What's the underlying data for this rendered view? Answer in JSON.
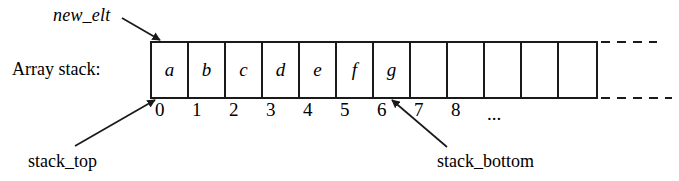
{
  "diagram": {
    "kind": "array-stack-illustration",
    "caption_label": "Array stack:",
    "pointers": {
      "new_elt": "new_elt",
      "stack_top": "stack_top",
      "stack_bottom": "stack_bottom"
    },
    "array": {
      "cell_count": 12,
      "cells": [
        {
          "index": "0",
          "value": "a"
        },
        {
          "index": "1",
          "value": "b"
        },
        {
          "index": "2",
          "value": "c"
        },
        {
          "index": "3",
          "value": "d"
        },
        {
          "index": "4",
          "value": "e"
        },
        {
          "index": "5",
          "value": "f"
        },
        {
          "index": "6",
          "value": "g"
        },
        {
          "index": "7",
          "value": ""
        },
        {
          "index": "8",
          "value": ""
        },
        {
          "index": "",
          "value": ""
        },
        {
          "index": "",
          "value": ""
        },
        {
          "index": "",
          "value": ""
        }
      ],
      "index_labels": [
        "0",
        "1",
        "2",
        "3",
        "4",
        "5",
        "6",
        "7",
        "8",
        "..."
      ],
      "continuation_marker": "..."
    },
    "colors": {
      "ink": "#1a1a1a",
      "background": "#ffffff"
    }
  }
}
